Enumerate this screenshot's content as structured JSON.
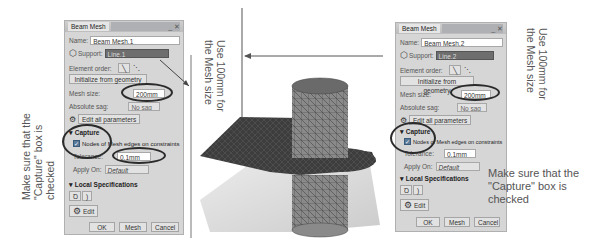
{
  "left_dialog": {
    "title": "Beam Mesh",
    "window_controls": "_ ✕",
    "name_label": "Name:",
    "name_value": "Beam Mesh.1",
    "support_label": "Support:",
    "support_value": "Line.1",
    "element_order_label": "Element order:",
    "init_button": "Initialize from geometry",
    "mesh_size_label": "Mesh size:",
    "mesh_size_value": "200mm",
    "absolute_sag_label": "Absolute sag:",
    "absolute_sag_value": "No sag",
    "edit_all_button": "Edit all parameters",
    "capture_section": "Capture",
    "capture_checkbox_label": "Nodes of Mesh edges on constraints",
    "capture_checked": true,
    "tolerance_label": "Tolerance:",
    "tolerance_value": "0.1mm",
    "apply_on_label": "Apply On:",
    "apply_on_value": "Default",
    "local_spec_section": "Local Specifications",
    "edit_button": "Edit",
    "ok_button": "OK",
    "mesh_button": "Mesh",
    "cancel_button": "Cancel"
  },
  "right_dialog": {
    "title": "Beam Mesh",
    "window_controls": "_ ✕",
    "name_label": "Name:",
    "name_value": "Beam Mesh.2",
    "support_label": "Support:",
    "support_value": "Line.2",
    "element_order_label": "Element order:",
    "init_button": "Initialize from geometry",
    "mesh_size_label": "Mesh size:",
    "mesh_size_value": "200mm",
    "absolute_sag_label": "Absolute sag:",
    "absolute_sag_value": "No sag",
    "edit_all_button": "Edit all parameters",
    "capture_section": "Capture",
    "capture_checkbox_label": "Nodes of Mesh edges on constraints",
    "capture_checked": true,
    "tolerance_label": "Tolerance:",
    "tolerance_value": "0.1mm",
    "apply_on_label": "Apply On:",
    "apply_on_value": "Default",
    "local_spec_section": "Local Specifications",
    "edit_button": "Edit",
    "ok_button": "OK",
    "mesh_button": "Mesh",
    "cancel_button": "Cancel"
  },
  "annotations": {
    "left_capture_line1": "Make sure that the",
    "left_capture_line2": "\"Capture\" box is",
    "left_capture_line3": "checked",
    "left_mesh_line1": "Use 100mm for",
    "left_mesh_line2": "the Mesh size",
    "right_mesh_line1": "Use 100mm for",
    "right_mesh_line2": "the Mesh size",
    "right_capture_line1": "Make sure that the",
    "right_capture_line2": "\"Capture\" box is",
    "right_capture_line3": "checked"
  },
  "colors": {
    "dialog_bg": "#d6d6d6",
    "support_field": "#6e6e6e",
    "mesh_dark": "#3a3a3a",
    "highlight_ellipse": "#2b2b2b",
    "annotation_text": "#555555"
  }
}
